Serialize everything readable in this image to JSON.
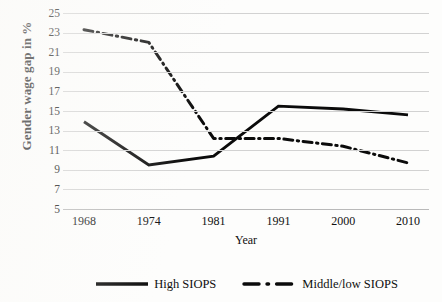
{
  "chart_data": {
    "type": "line",
    "title": "",
    "xlabel": "Year",
    "ylabel": "Gender wage gap in %",
    "categories": [
      "1968",
      "1974",
      "1981",
      "1991",
      "2000",
      "2010"
    ],
    "ylim": [
      5,
      25
    ],
    "yticks": [
      5,
      7,
      9,
      11,
      13,
      15,
      17,
      19,
      21,
      23,
      25
    ],
    "grid": true,
    "legend_position": "bottom",
    "series": [
      {
        "name": "High SIOPS",
        "style": "solid",
        "color": "#0b0b0b",
        "values": [
          13.9,
          9.5,
          10.4,
          15.5,
          15.2,
          14.6
        ]
      },
      {
        "name": "Middle/low SIOPS",
        "style": "dash-dot",
        "color": "#0b0b0b",
        "values": [
          23.3,
          22.0,
          12.2,
          12.2,
          11.4,
          9.7
        ]
      }
    ]
  },
  "axis": {
    "y_tick_labels": [
      "25",
      "23",
      "21",
      "19",
      "17",
      "15",
      "13",
      "11",
      "9",
      "7",
      "5"
    ],
    "x_tick_labels": [
      "1968",
      "1974",
      "1981",
      "1991",
      "2000",
      "2010"
    ],
    "y_title": "Gender wage gap in %",
    "x_title": "Year"
  },
  "legend": {
    "items": [
      {
        "label": "High SIOPS",
        "marker": "solid-line-swatch"
      },
      {
        "label": "Middle/low SIOPS",
        "marker": "dash-dot-line-swatch"
      }
    ]
  }
}
